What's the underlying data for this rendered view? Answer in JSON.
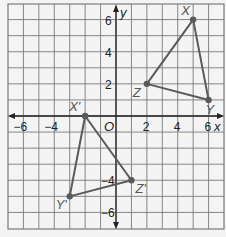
{
  "diagram": {
    "type": "coordinate-plane-transformation",
    "grid": {
      "x_min": -7,
      "x_max": 7,
      "y_min": -7,
      "y_max": 7,
      "step": 1
    },
    "axes": {
      "x_label": "x",
      "y_label": "y",
      "origin_label": "O",
      "x_ticks": [
        {
          "value": -6,
          "label": "−6"
        },
        {
          "value": -4,
          "label": "−4"
        },
        {
          "value": 2,
          "label": "2"
        },
        {
          "value": 4,
          "label": "4"
        },
        {
          "value": 6,
          "label": "6"
        }
      ],
      "y_ticks": [
        {
          "value": 6,
          "label": "6"
        },
        {
          "value": 4,
          "label": "4"
        },
        {
          "value": 2,
          "label": "2"
        },
        {
          "value": -4,
          "label": "−4"
        },
        {
          "value": -6,
          "label": "−6"
        }
      ]
    },
    "triangles": [
      {
        "name": "XYZ",
        "vertices": [
          {
            "label": "X",
            "x": 5,
            "y": 6
          },
          {
            "label": "Y",
            "x": 6,
            "y": 1
          },
          {
            "label": "Z",
            "x": 2,
            "y": 2
          }
        ]
      },
      {
        "name": "X'Y'Z'",
        "vertices": [
          {
            "label": "X'",
            "x": -2,
            "y": 0
          },
          {
            "label": "Y'",
            "x": -3,
            "y": -5
          },
          {
            "label": "Z'",
            "x": 1,
            "y": -4
          }
        ]
      }
    ],
    "colors": {
      "background": "#f4f4f4",
      "grid": "#7a7a7a",
      "axis": "#222222",
      "triangle": "#5a5a5a",
      "vertex_label": "#555555"
    }
  }
}
